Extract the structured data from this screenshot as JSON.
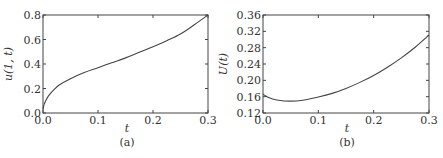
{
  "chart_data": [
    {
      "type": "line",
      "panel": "(a)",
      "title": "",
      "xlabel": "t",
      "ylabel": "u(1, t)",
      "xlim": [
        0.0,
        0.3
      ],
      "ylim": [
        0.0,
        0.8
      ],
      "xticks": [
        "0.0",
        "0.1",
        "0.2",
        "0.3"
      ],
      "yticks": [
        "0.0",
        "0.2",
        "0.4",
        "0.6",
        "0.8"
      ],
      "grid": false,
      "series": [
        {
          "name": "u(1,t)",
          "x": [
            0.0,
            0.002,
            0.005,
            0.01,
            0.02,
            0.03,
            0.05,
            0.075,
            0.1,
            0.125,
            0.15,
            0.175,
            0.2,
            0.225,
            0.25,
            0.275,
            0.3
          ],
          "y": [
            0.03,
            0.07,
            0.1,
            0.14,
            0.19,
            0.23,
            0.28,
            0.33,
            0.37,
            0.41,
            0.45,
            0.495,
            0.54,
            0.59,
            0.645,
            0.72,
            0.8
          ]
        }
      ]
    },
    {
      "type": "line",
      "panel": "(b)",
      "title": "",
      "xlabel": "t",
      "ylabel": "U(t)",
      "xlim": [
        0.0,
        0.3
      ],
      "ylim": [
        0.12,
        0.36
      ],
      "xticks": [
        "0.0",
        "0.1",
        "0.2",
        "0.3"
      ],
      "yticks": [
        "0.12",
        "0.16",
        "0.20",
        "0.24",
        "0.28",
        "0.32",
        "0.36"
      ],
      "grid": false,
      "series": [
        {
          "name": "U(t)",
          "x": [
            0.0,
            0.01,
            0.025,
            0.05,
            0.075,
            0.1,
            0.125,
            0.15,
            0.175,
            0.2,
            0.225,
            0.25,
            0.275,
            0.3
          ],
          "y": [
            0.166,
            0.158,
            0.152,
            0.149,
            0.152,
            0.159,
            0.168,
            0.18,
            0.195,
            0.212,
            0.232,
            0.255,
            0.281,
            0.311
          ]
        }
      ]
    }
  ],
  "captions": {
    "a": "(a)",
    "b": "(b)"
  },
  "axes": {
    "a": {
      "xlabel": "t",
      "ylabel": "u(1, t)"
    },
    "b": {
      "xlabel": "t",
      "ylabel": "U(t)"
    }
  }
}
